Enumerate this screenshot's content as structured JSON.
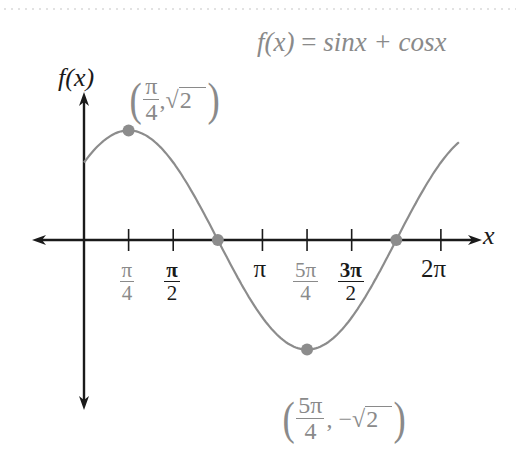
{
  "chart_data": {
    "type": "line",
    "title": "f(x) = sinx + cosx",
    "xlabel": "x",
    "ylabel": "f(x)",
    "function": "sin(x) + cos(x)",
    "x_domain": [
      0,
      6.6
    ],
    "ylim": [
      -1.55,
      1.55
    ],
    "x_ticks": [
      {
        "value": 0.7854,
        "label_num": "π",
        "label_den": "4",
        "style": "gray"
      },
      {
        "value": 1.5708,
        "label_num": "π",
        "label_den": "2",
        "style": "dark"
      },
      {
        "value": 3.1416,
        "label": "π",
        "style": "dark"
      },
      {
        "value": 3.927,
        "label_num": "5π",
        "label_den": "4",
        "style": "gray"
      },
      {
        "value": 4.7124,
        "label_num": "3π",
        "label_den": "2",
        "style": "dark"
      },
      {
        "value": 6.2832,
        "label": "2π",
        "style": "dark"
      }
    ],
    "highlighted_points": [
      {
        "x": 0.7854,
        "y": 1.4142,
        "label_x_num": "π",
        "label_x_den": "4",
        "label_y": "√2",
        "kind": "maximum"
      },
      {
        "x": 2.3562,
        "y": 0,
        "kind": "x-intercept"
      },
      {
        "x": 3.927,
        "y": -1.4142,
        "label_x_num": "5π",
        "label_x_den": "4",
        "label_y": "−√2",
        "kind": "minimum"
      },
      {
        "x": 5.4978,
        "y": 0,
        "kind": "x-intercept"
      }
    ],
    "grid": false,
    "legend": null
  },
  "labels": {
    "title_lhs": "f(x)",
    "title_eq": " = ",
    "title_rhs": "sinx + cosx",
    "y_axis": "f(x)",
    "x_axis": "x",
    "max_point": {
      "open": "(",
      "num": "π",
      "den": "4",
      "sep": ",",
      "val": "2",
      "close": ")"
    },
    "min_point": {
      "open": "(",
      "num": "5π",
      "den": "4",
      "sep": ",",
      "neg": "−",
      "val": "2",
      "close": ")"
    }
  },
  "colors": {
    "curve": "#8c8c8c",
    "point": "#8c8c8c",
    "axes": "#1a1a1a",
    "gray_text": "#8a8a8a",
    "dark_text": "#1a1a1a",
    "top_rule": "#e2e2e2"
  }
}
